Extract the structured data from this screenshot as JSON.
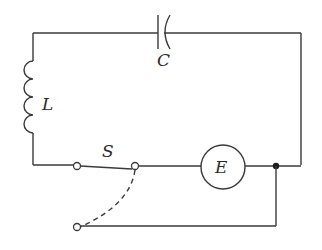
{
  "diagram": {
    "type": "circuit",
    "title": "",
    "components": [
      {
        "id": "capacitor",
        "label": "C",
        "kind": "capacitor"
      },
      {
        "id": "inductor",
        "label": "L",
        "kind": "inductor"
      },
      {
        "id": "switch",
        "label": "S",
        "kind": "single-pole double-throw switch"
      },
      {
        "id": "emf",
        "label": "E",
        "kind": "emf source (circle)"
      }
    ],
    "switch_positions": [
      "closed to source E (solid)",
      "alternate to return wire (dashed)"
    ],
    "colors": {
      "line": "#3a3a3a",
      "background": "#ffffff"
    }
  }
}
